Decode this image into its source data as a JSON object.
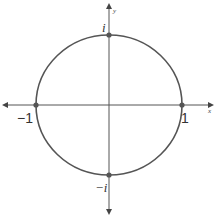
{
  "diagram": {
    "axes": {
      "x_label": "x",
      "y_label": "y"
    },
    "points": [
      {
        "name": "one",
        "label": "1"
      },
      {
        "name": "minus-one",
        "label": "−1"
      },
      {
        "name": "i",
        "label": "i"
      },
      {
        "name": "minus-i",
        "label": "−i"
      }
    ],
    "colors": {
      "stroke": "#555555",
      "point": "#555555"
    }
  }
}
